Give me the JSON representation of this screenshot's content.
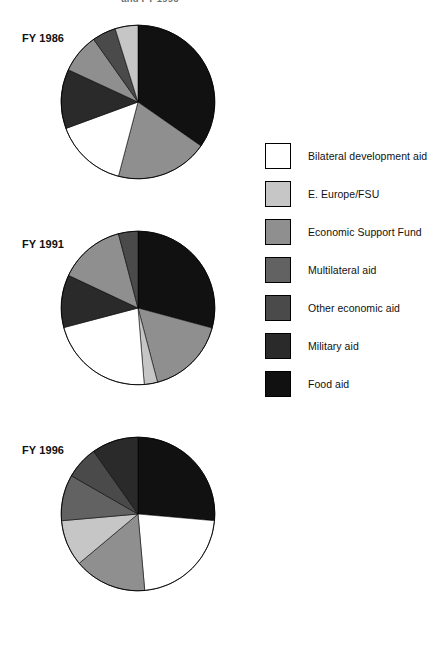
{
  "figure": {
    "caption": "and FY 1996",
    "background": "#ffffff"
  },
  "legend": {
    "title": "",
    "items": [
      {
        "label": "Bilateral development aid",
        "color": "#ffffff",
        "key": "bilateral-development-aid"
      },
      {
        "label": "E. Europe/FSU",
        "color": "#c6c6c6",
        "key": "e-europe-fsu"
      },
      {
        "label": "Economic Support Fund",
        "color": "#8f8f8f",
        "key": "economic-support-fund"
      },
      {
        "label": "Multilateral aid",
        "color": "#626262",
        "key": "multilateral-aid"
      },
      {
        "label": "Other economic aid",
        "color": "#4a4a4a",
        "key": "other-economic-aid"
      },
      {
        "label": "Military aid",
        "color": "#2a2a2a",
        "key": "military-aid"
      },
      {
        "label": "Food aid",
        "color": "#111111",
        "key": "food-aid"
      }
    ]
  },
  "chart_data": [
    {
      "type": "pie",
      "title": "FY 1986",
      "start_angle": 0,
      "direction": "clockwise",
      "categories": [
        "Food aid",
        "Economic Support Fund",
        "Bilateral development aid",
        "Military aid",
        "Multilateral aid",
        "Other economic aid",
        "E. Europe/FSU"
      ],
      "colors": [
        "#111111",
        "#8f8f8f",
        "#ffffff",
        "#2a2a2a",
        "#8f8f8f",
        "#4a4a4a",
        "#c6c6c6"
      ],
      "values": [
        34.7,
        19.4,
        15.3,
        12.5,
        8.3,
        5.0,
        4.8
      ],
      "unit": "percent"
    },
    {
      "type": "pie",
      "title": "FY 1991",
      "start_angle": 0,
      "direction": "clockwise",
      "categories": [
        "Food aid",
        "Economic Support Fund",
        "E. Europe/FSU",
        "Bilateral development aid",
        "Military aid",
        "Multilateral aid",
        "Other economic aid"
      ],
      "colors": [
        "#111111",
        "#8f8f8f",
        "#c6c6c6",
        "#ffffff",
        "#2a2a2a",
        "#8f8f8f",
        "#4a4a4a"
      ],
      "values": [
        29.2,
        16.7,
        2.8,
        22.2,
        11.1,
        13.9,
        4.1
      ],
      "unit": "percent"
    },
    {
      "type": "pie",
      "title": "FY 1996",
      "start_angle": 0,
      "direction": "clockwise",
      "categories": [
        "Food aid",
        "Bilateral development aid",
        "Economic Support Fund",
        "E. Europe/FSU",
        "Multilateral aid",
        "Other economic aid",
        "Military aid"
      ],
      "colors": [
        "#111111",
        "#ffffff",
        "#8f8f8f",
        "#c6c6c6",
        "#626262",
        "#4a4a4a",
        "#2a2a2a"
      ],
      "values": [
        26.4,
        22.2,
        15.3,
        9.7,
        9.7,
        6.9,
        9.8
      ],
      "unit": "percent"
    }
  ]
}
